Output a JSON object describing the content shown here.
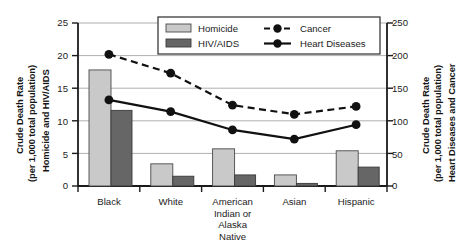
{
  "chart_data": {
    "type": "bar",
    "title": "",
    "subtitle": "",
    "categories": [
      "Black",
      "White",
      "American\nIndian or\nAlaska\nNative",
      "Asian",
      "Hispanic"
    ],
    "category_labels_flat": [
      "Black",
      "White",
      "American Indian or Alaska Native",
      "Asian",
      "Hispanic"
    ],
    "series": [
      {
        "name": "Homicide",
        "type": "bar",
        "axis": "left",
        "color": "#c9c9c9",
        "values": [
          17.8,
          3.4,
          5.7,
          1.7,
          5.4
        ]
      },
      {
        "name": "HIV/AIDS",
        "type": "bar",
        "axis": "left",
        "color": "#666666",
        "values": [
          11.6,
          1.5,
          1.7,
          0.4,
          2.9
        ]
      },
      {
        "name": "Cancer",
        "type": "line",
        "axis": "right",
        "style": "dashed",
        "color": "#111111",
        "values": [
          202,
          173,
          124,
          110,
          122
        ]
      },
      {
        "name": "Heart Diseases",
        "type": "line",
        "axis": "right",
        "style": "solid",
        "color": "#111111",
        "values": [
          132,
          114,
          86,
          72,
          94
        ]
      }
    ],
    "left_axis": {
      "label_line1": "Crude Death Rate",
      "label_line2": "(per 1,000 total population)",
      "label_line3": "Homicide and HIV/AIDS",
      "ticks": [
        0,
        5,
        10,
        15,
        20,
        25
      ],
      "min": 0,
      "max": 25
    },
    "right_axis": {
      "label_line1": "Crude Death Rate",
      "label_line2": "(per 1,000 total population)",
      "label_line3": "Heart Diseases and Cancer",
      "ticks": [
        0,
        50,
        100,
        150,
        200,
        250
      ],
      "min": 0,
      "max": 250
    },
    "xlabel": "",
    "grid": true,
    "legend": {
      "position": "top-center-inside",
      "entries": [
        {
          "label": "Homicide",
          "marker": "bar-light"
        },
        {
          "label": "Cancer",
          "marker": "line-dashed-dot"
        },
        {
          "label": "HIV/AIDS",
          "marker": "bar-dark"
        },
        {
          "label": "Heart Diseases",
          "marker": "line-solid-dot"
        }
      ]
    }
  },
  "axes": {
    "left_title_1": "Crude Death Rate",
    "left_title_2": "(per 1,000 total population)",
    "left_title_3": "Homicide and HIV/AIDS",
    "right_title_1": "Crude Death Rate",
    "right_title_2": "(per 1,000 total population)",
    "right_title_3": "Heart Diseases and Cancer",
    "left_ticks": [
      "25",
      "20",
      "15",
      "10",
      "5",
      "0"
    ],
    "right_ticks": [
      "250",
      "200",
      "150",
      "100",
      "50",
      "0"
    ]
  },
  "legend": {
    "homicide": "Homicide",
    "hiv_aids": "HIV/AIDS",
    "cancer": "Cancer",
    "heart_diseases": "Heart Diseases"
  },
  "categories": {
    "c0": "Black",
    "c1": "White",
    "c2": "American\nIndian or\nAlaska\nNative",
    "c3": "Asian",
    "c4": "Hispanic"
  },
  "colors": {
    "homicide_bar": "#c9c9c9",
    "hiv_bar": "#666666",
    "line": "#111111",
    "grid": "#9a9a9a",
    "axis": "#1a1a1a",
    "background": "#ffffff"
  }
}
